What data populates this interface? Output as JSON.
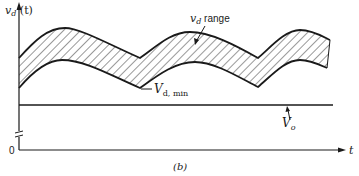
{
  "figure": {
    "y_axis_label": "v",
    "y_axis_label_sub": "d",
    "y_axis_label_arg": " (t)",
    "x_axis_label": "t",
    "origin_label": "0",
    "range_label_v": "v",
    "range_label_sub": "d",
    "range_label_text": " range",
    "vdmin_label_v": "V",
    "vdmin_label_sub": "d, min",
    "vo_label_v": "V",
    "vo_label_sub": "o",
    "caption": "(b)"
  },
  "colors": {
    "stroke": "#1a1a1a",
    "hatch": "#333333",
    "background": "#ffffff"
  }
}
